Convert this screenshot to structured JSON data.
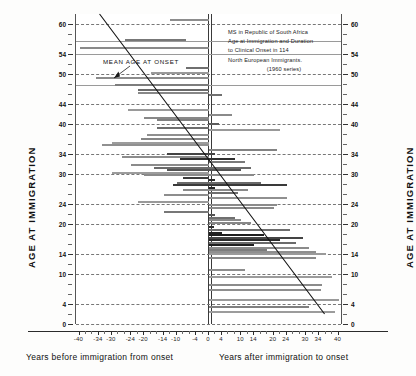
{
  "chart_data": {
    "type": "bar",
    "orientation": "horizontal-diverging",
    "title": "MS in Republic of South Africa Age at Immigration and Duration to Clinical Onset in 114 North European Immigrants. (1960 series)",
    "title_lines": [
      "MS in Republic of South Africa",
      "Age at Immigration and Duration",
      "to Clinical Onset in 114",
      "North European Immigrants.",
      "(1960 series)"
    ],
    "xlabel_left": "Years before immigration from onset",
    "xlabel_right": "Years after immigration to onset",
    "ylabel_left": "AGE AT IMMIGRATION",
    "ylabel_right": "AGE AT IMMIGRATION",
    "xlim": [
      -40,
      40
    ],
    "ylim": [
      0,
      62
    ],
    "xticks_major": [
      -40,
      -34,
      -30,
      -24,
      -20,
      -14,
      -10,
      -4,
      0,
      4,
      10,
      14,
      20,
      24,
      30,
      34,
      40
    ],
    "xticks_minor": [
      -38,
      -36,
      -32,
      -28,
      -26,
      -22,
      -18,
      -16,
      -12,
      -8,
      -6,
      -2,
      2,
      6,
      8,
      12,
      16,
      18,
      22,
      26,
      28,
      32,
      36,
      38
    ],
    "yticks_major": [
      0,
      4,
      10,
      14,
      20,
      24,
      30,
      34,
      40,
      44,
      50,
      54,
      60
    ],
    "yticks_minor": [
      2,
      6,
      8,
      12,
      16,
      18,
      22,
      26,
      28,
      32,
      36,
      38,
      42,
      46,
      48,
      52,
      56,
      58
    ],
    "annotation": "MEAN AGE AT ONSET",
    "grid": "horizontal dashed at major ticks",
    "legend": "none",
    "trend_line": {
      "label": "MEAN AGE AT ONSET",
      "x_start": -33.5,
      "y_start": 62,
      "x_end": 36.0,
      "y_end": 2.0
    },
    "bars": [
      {
        "age": 61.0,
        "from": -12.0,
        "to": 0.0,
        "shade": "#8d8d8d"
      },
      {
        "age": 57.0,
        "from": -26.0,
        "to": -7.0,
        "shade": "#777777"
      },
      {
        "age": 55.5,
        "from": -40.0,
        "to": 0.0,
        "shade": "#8a8a8a"
      },
      {
        "age": 51.5,
        "from": -7.0,
        "to": 0.0,
        "shade": "#6f6f6f"
      },
      {
        "age": 50.5,
        "from": -18.0,
        "to": 0.0,
        "shade": "#9a9a9a"
      },
      {
        "age": 49.5,
        "from": -35.0,
        "to": 0.0,
        "shade": "#8b8b8b"
      },
      {
        "age": 48.0,
        "from": -29.0,
        "to": 0.0,
        "shade": "#7d7d7d"
      },
      {
        "age": 47.0,
        "from": -22.0,
        "to": 0.0,
        "shade": "#6a6a6a"
      },
      {
        "age": 46.5,
        "from": -22.0,
        "to": 0.0,
        "shade": "#878787"
      },
      {
        "age": 46.0,
        "from": 0.0,
        "to": 4.0,
        "shade": "#707070"
      },
      {
        "age": 43.0,
        "from": -25.0,
        "to": 0.0,
        "shade": "#9a9a9a"
      },
      {
        "age": 42.0,
        "from": 0.0,
        "to": 7.0,
        "shade": "#8a8a8a"
      },
      {
        "age": 41.5,
        "from": -20.0,
        "to": 0.0,
        "shade": "#888888"
      },
      {
        "age": 41.0,
        "from": -16.0,
        "to": 0.0,
        "shade": "#808080"
      },
      {
        "age": 40.2,
        "from": 0.0,
        "to": 3.0,
        "shade": "#5c5c5c"
      },
      {
        "age": 39.5,
        "from": -16.0,
        "to": 0.0,
        "shade": "#6d6d6d"
      },
      {
        "age": 39.0,
        "from": 0.0,
        "to": 22.0,
        "shade": "#999999"
      },
      {
        "age": 38.0,
        "from": -19.0,
        "to": 0.0,
        "shade": "#8f8f8f"
      },
      {
        "age": 37.2,
        "from": -21.0,
        "to": 0.0,
        "shade": "#858585"
      },
      {
        "age": 36.5,
        "from": -30.0,
        "to": 0.0,
        "shade": "#9c9c9c"
      },
      {
        "age": 36.0,
        "from": -33.0,
        "to": 0.0,
        "shade": "#909090"
      },
      {
        "age": 35.0,
        "from": 0.0,
        "to": 21.0,
        "shade": "#838383"
      },
      {
        "age": 34.2,
        "from": -13.0,
        "to": 2.0,
        "shade": "#444444"
      },
      {
        "age": 33.6,
        "from": -27.0,
        "to": 0.0,
        "shade": "#8c8c8c"
      },
      {
        "age": 33.2,
        "from": -9.0,
        "to": 8.0,
        "shade": "#2f2f2f"
      },
      {
        "age": 32.6,
        "from": 0.0,
        "to": 11.0,
        "shade": "#7a7a7a"
      },
      {
        "age": 32.0,
        "from": -24.0,
        "to": 0.0,
        "shade": "#8b8b8b"
      },
      {
        "age": 31.5,
        "from": -17.0,
        "to": 13.0,
        "shade": "#6b6b6b"
      },
      {
        "age": 31.0,
        "from": -13.0,
        "to": 10.0,
        "shade": "#555555"
      },
      {
        "age": 30.4,
        "from": -30.0,
        "to": 0.0,
        "shade": "#9c9c9c"
      },
      {
        "age": 30.0,
        "from": -20.0,
        "to": 14.0,
        "shade": "#8a8a8a"
      },
      {
        "age": 29.4,
        "from": -8.0,
        "to": 0.0,
        "shade": "#3c3c3c"
      },
      {
        "age": 29.0,
        "from": 0.0,
        "to": 2.0,
        "shade": "#2a2a2a"
      },
      {
        "age": 28.4,
        "from": -10.0,
        "to": 16.0,
        "shade": "#6a6a6a"
      },
      {
        "age": 28.0,
        "from": -11.0,
        "to": 24.0,
        "shade": "#3a3a3a"
      },
      {
        "age": 27.4,
        "from": 0.0,
        "to": 2.0,
        "shade": "#242424"
      },
      {
        "age": 27.0,
        "from": -8.0,
        "to": 12.0,
        "shade": "#8a8a8a"
      },
      {
        "age": 26.4,
        "from": 0.0,
        "to": 9.0,
        "shade": "#6f6f6f"
      },
      {
        "age": 26.0,
        "from": -14.0,
        "to": 0.0,
        "shade": "#8d8d8d"
      },
      {
        "age": 25.4,
        "from": 0.0,
        "to": 24.0,
        "shade": "#909090"
      },
      {
        "age": 24.6,
        "from": -22.0,
        "to": 0.0,
        "shade": "#9a9a9a"
      },
      {
        "age": 24.0,
        "from": 0.0,
        "to": 21.0,
        "shade": "#8b8b8b"
      },
      {
        "age": 23.4,
        "from": 0.0,
        "to": 20.0,
        "shade": "#8a8a8a"
      },
      {
        "age": 22.6,
        "from": -14.0,
        "to": 0.0,
        "shade": "#777777"
      },
      {
        "age": 22.0,
        "from": 0.0,
        "to": 2.0,
        "shade": "#555555"
      },
      {
        "age": 21.4,
        "from": 0.0,
        "to": 8.0,
        "shade": "#707070"
      },
      {
        "age": 21.0,
        "from": 0.0,
        "to": 10.0,
        "shade": "#8a8a8a"
      },
      {
        "age": 20.4,
        "from": 0.0,
        "to": 13.0,
        "shade": "#888888"
      },
      {
        "age": 19.6,
        "from": 0.0,
        "to": 1.5,
        "shade": "#2b2b2b"
      },
      {
        "age": 19.0,
        "from": 0.0,
        "to": 25.0,
        "shade": "#6e6e6e"
      },
      {
        "age": 18.4,
        "from": 0.0,
        "to": 4.0,
        "shade": "#232323"
      },
      {
        "age": 18.0,
        "from": 0.0,
        "to": 17.0,
        "shade": "#1e1e1e"
      },
      {
        "age": 17.4,
        "from": 0.0,
        "to": 29.0,
        "shade": "#444444"
      },
      {
        "age": 17.0,
        "from": 0.0,
        "to": 22.0,
        "shade": "#2a2a2a"
      },
      {
        "age": 16.4,
        "from": 0.0,
        "to": 27.0,
        "shade": "#6b6b6b"
      },
      {
        "age": 16.0,
        "from": 0.0,
        "to": 14.0,
        "shade": "#1f1f1f"
      },
      {
        "age": 15.4,
        "from": 0.0,
        "to": 31.0,
        "shade": "#8b8b8b"
      },
      {
        "age": 15.0,
        "from": 0.0,
        "to": 18.0,
        "shade": "#7c7c7c"
      },
      {
        "age": 14.6,
        "from": 0.0,
        "to": 33.0,
        "shade": "#8f8f8f"
      },
      {
        "age": 14.2,
        "from": 0.0,
        "to": 36.0,
        "shade": "#9a9a9a"
      },
      {
        "age": 13.4,
        "from": 0.0,
        "to": 33.0,
        "shade": "#8a8a8a"
      },
      {
        "age": 11.0,
        "from": 0.0,
        "to": 11.0,
        "shade": "#8d8d8d"
      },
      {
        "age": 9.6,
        "from": 0.0,
        "to": 38.0,
        "shade": "#9b9b9b"
      },
      {
        "age": 8.0,
        "from": 0.0,
        "to": 35.0,
        "shade": "#8b8b8b"
      },
      {
        "age": 7.0,
        "from": 0.0,
        "to": 34.5,
        "shade": "#8e8e8e"
      },
      {
        "age": 5.0,
        "from": 0.0,
        "to": 40.0,
        "shade": "#9a9a9a"
      },
      {
        "age": 3.6,
        "from": 0.0,
        "to": 31.0,
        "shade": "#7f7f7f"
      },
      {
        "age": 2.6,
        "from": 0.0,
        "to": 39.0,
        "shade": "#9c9c9c"
      }
    ]
  }
}
